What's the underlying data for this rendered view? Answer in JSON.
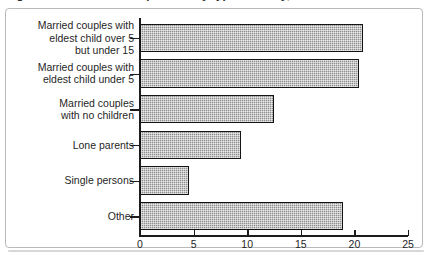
{
  "figure": {
    "title": "Figure 3: Household composition by type of family, 2001"
  },
  "chart_data": {
    "type": "bar",
    "orientation": "horizontal",
    "title": "",
    "xlabel": "",
    "ylabel": "",
    "categories": [
      "Married couples with\neldest child over 5\nbut under 15",
      "Married couples with\neldest child under 5",
      "Married couples\nwith no children",
      "Lone parents",
      "Single persons",
      "Other"
    ],
    "values": [
      20.8,
      20.4,
      12.5,
      9.4,
      4.6,
      18.9
    ],
    "xlim": [
      0,
      25
    ],
    "xticks": [
      0,
      5,
      10,
      15,
      20,
      25
    ],
    "xtick_labels": [
      "0",
      "5",
      "10",
      "15",
      "20",
      "25"
    ],
    "grid": false,
    "legend": false,
    "bar_fill_color": "#8e8e8e",
    "bar_edge_color": "#141414",
    "axis_color": "#1c1c1c",
    "frame_color": "#b9b9b9"
  }
}
